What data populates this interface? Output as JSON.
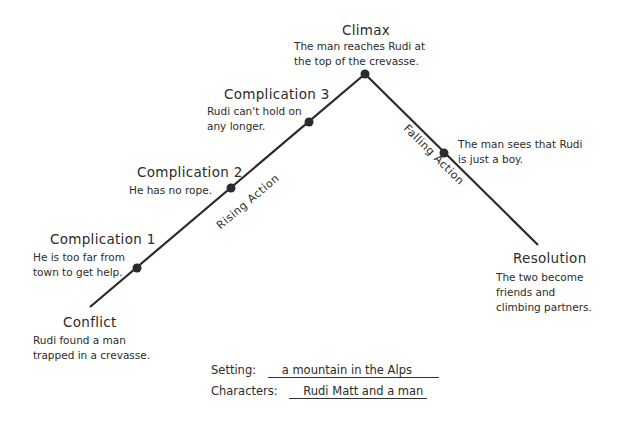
{
  "diagram": {
    "type": "plot-diagram",
    "line_color": "#2b2b2b",
    "text_color": "#2b2b2b",
    "points": {
      "start": [
        90,
        307
      ],
      "peak": [
        365,
        74
      ],
      "end": [
        538,
        245
      ]
    },
    "nodes": [
      {
        "id": "complication1",
        "dot": [
          137,
          268
        ]
      },
      {
        "id": "complication2",
        "dot": [
          231,
          188
        ]
      },
      {
        "id": "complication3",
        "dot": [
          309,
          122
        ]
      },
      {
        "id": "climax",
        "dot": [
          365,
          74
        ]
      },
      {
        "id": "falling",
        "dot": [
          444,
          153
        ]
      }
    ]
  },
  "labels": {
    "climax": {
      "title": "Climax",
      "line1": "The man reaches Rudi at",
      "line2": "the top of the crevasse."
    },
    "complication3": {
      "title": "Complication 3",
      "line1": "Rudi can't hold on",
      "line2": "any longer."
    },
    "complication2": {
      "title": "Complication 2",
      "line1": "He has no rope."
    },
    "complication1": {
      "title": "Complication 1",
      "line1": "He is too far from",
      "line2": "town to get help."
    },
    "conflict": {
      "title": "Conflict",
      "line1": "Rudi found a man",
      "line2": "trapped in a crevasse."
    },
    "falling_event": {
      "line1": "The man sees that Rudi",
      "line2": "is just a boy."
    },
    "resolution": {
      "title": "Resolution",
      "line1": "The two become",
      "line2": "friends and",
      "line3": "climbing partners."
    },
    "rising_action": "Rising Action",
    "falling_action": "Falling Action"
  },
  "fields": {
    "setting": {
      "label": "Setting:",
      "value": "a mountain in the Alps"
    },
    "characters": {
      "label": "Characters:",
      "value": "Rudi Matt and a man"
    }
  }
}
